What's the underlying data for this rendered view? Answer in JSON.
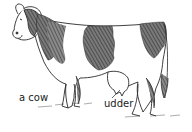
{
  "figure": {
    "labels": {
      "animal": "a cow",
      "part": "udder"
    },
    "colors": {
      "background": "#ffffff",
      "outline": "#2a2a2a",
      "patch": "#555555",
      "text": "#222222"
    }
  }
}
